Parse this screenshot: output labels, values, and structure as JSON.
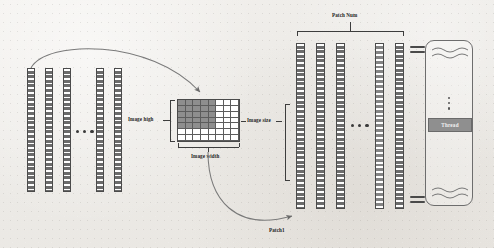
{
  "figure": {
    "background_color": "#efedea",
    "bar_color": "#6b6b6b",
    "grid_fill_color": "#8e8e8e",
    "thread_chip_color": "#8f8f8f"
  },
  "labels": {
    "image_high": "Image high",
    "image_width": "Image width",
    "image_size": "Image size",
    "patch_num": "Patch Num",
    "patch1": "Patch1",
    "thread": "Thread"
  },
  "left_group": {
    "bar_count": 5,
    "ellipsis": "• • •",
    "bars": [
      {
        "x": 27,
        "y": 68,
        "w": 8,
        "h": 124,
        "shade": "dark"
      },
      {
        "x": 45,
        "y": 68,
        "w": 8,
        "h": 124,
        "shade": "dark"
      },
      {
        "x": 63,
        "y": 68,
        "w": 8,
        "h": 124,
        "shade": "dark"
      },
      {
        "x": 96,
        "y": 68,
        "w": 8,
        "h": 124,
        "shade": "dark"
      },
      {
        "x": 114,
        "y": 68,
        "w": 8,
        "h": 124,
        "shade": "dark"
      }
    ],
    "dots_x": 76,
    "dots_y": 130
  },
  "grid": {
    "columns": 8,
    "rows": 7,
    "filled_columns": 5,
    "filled_rows": 5,
    "description": "Image represented as a grid of pixel patches; upper-left block shaded."
  },
  "right_group": {
    "bar_count": 5,
    "ellipsis": "• • •",
    "bars": [
      {
        "x": 296,
        "y": 43,
        "w": 9,
        "h": 166,
        "shade": "dark"
      },
      {
        "x": 316,
        "y": 43,
        "w": 9,
        "h": 166,
        "shade": "dark"
      },
      {
        "x": 336,
        "y": 43,
        "w": 9,
        "h": 166,
        "shade": "dark"
      },
      {
        "x": 375,
        "y": 43,
        "w": 9,
        "h": 166,
        "shade": "light"
      },
      {
        "x": 395,
        "y": 43,
        "w": 9,
        "h": 166,
        "shade": "dark"
      }
    ],
    "dots_x": 351,
    "dots_y": 124
  },
  "thread_panel": {
    "wave_lines_top": 2,
    "wave_lines_bottom": 2,
    "vertical_ellipsis": true
  },
  "equals_signs": [
    {
      "x": 410,
      "y": 46
    },
    {
      "x": 410,
      "y": 196
    }
  ],
  "arrows": [
    {
      "name": "bars-to-image",
      "from": "left bar stack top",
      "to": "image grid top"
    },
    {
      "name": "image-to-patch",
      "from": "image grid bottom",
      "to": "Patch1 bar"
    }
  ]
}
